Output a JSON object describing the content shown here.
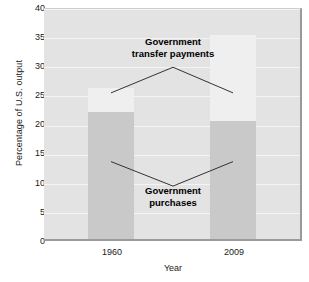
{
  "chart_data": {
    "type": "bar",
    "title": "",
    "subtitle": "",
    "xlabel": "Year",
    "ylabel": "Percentage of U.S. output",
    "categories": [
      "1960",
      "2009"
    ],
    "ylim": [
      0,
      40
    ],
    "yticks": [
      0,
      5,
      10,
      15,
      20,
      25,
      30,
      35,
      40
    ],
    "ytick_labels": [
      "0",
      "5",
      "10",
      "15",
      "20",
      "25",
      "30",
      "35",
      "40"
    ],
    "grid": true,
    "legend": "none",
    "stacked": true,
    "series": [
      {
        "name": "Government purchases",
        "color": "#c9c9c9",
        "values": [
          21.8,
          20.3
        ]
      },
      {
        "name": "Government transfer payments",
        "color": "#efefef",
        "values": [
          4.2,
          14.7
        ]
      }
    ],
    "segment_tops": {
      "purchases": [
        21.8,
        20.3
      ],
      "stack_totals": [
        26.0,
        35.0
      ]
    },
    "annotations": [
      {
        "id": "transfers",
        "lines": [
          "Government",
          "transfer payments"
        ],
        "text": "Government transfer payments",
        "apex_value": 30.0,
        "left_target_value": 25.6,
        "right_target_value": 25.6
      },
      {
        "id": "purchases",
        "lines": [
          "Government",
          "purchases"
        ],
        "text": "Government purchases",
        "apex_value": 9.6,
        "left_target_value": 13.8,
        "right_target_value": 13.8
      }
    ]
  },
  "axes": {
    "y_title": "Percentage of U.S. output",
    "x_title": "Year",
    "y_labels": [
      "40",
      "35",
      "30",
      "25",
      "20",
      "15",
      "10",
      "5",
      "0"
    ],
    "x_labels": [
      "1960",
      "2009"
    ]
  },
  "annotations": {
    "transfers_line1": "Government",
    "transfers_line2": "transfer payments",
    "purchases_line1": "Government",
    "purchases_line2": "purchases"
  },
  "colors": {
    "plot_background": "#e3e3e3",
    "gridline": "#f4f4f4",
    "purchases_fill": "#c9c9c9",
    "transfers_fill": "#efefef",
    "axis_border": "#9a9a9a",
    "text": "#1a1a1a",
    "leader_line": "#333333"
  }
}
